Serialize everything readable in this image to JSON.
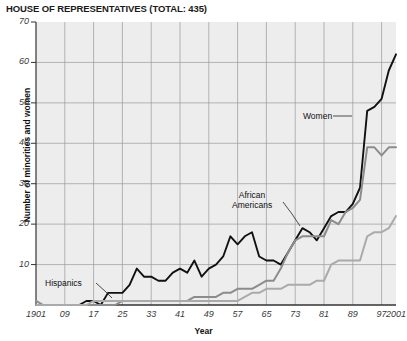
{
  "chart": {
    "title": "HOUSE OF REPRESENTATIVES (TOTAL: 435)",
    "xlabel": "Year",
    "ylabel": "Number of minorities and women"
  },
  "annotations": {
    "women": "Women",
    "african_americans_line1": "African",
    "african_americans_line2": "Americans",
    "hispanics": "Hispanics"
  },
  "axis": {
    "y_ticks": [
      "70",
      "60",
      "50",
      "40",
      "30",
      "20",
      "10"
    ],
    "x_ticks": [
      "1901",
      "09",
      "17",
      "25",
      "33",
      "41",
      "49",
      "57",
      "65",
      "73",
      "81",
      "89",
      "97",
      "2001"
    ]
  },
  "colors": {
    "women_line": "#111111",
    "african_americans_line": "#8c8c8c",
    "hispanics_line": "#aaaaaa",
    "plot_background": "#eeeeee",
    "gridline": "#9a9a9a",
    "axis": "#333333"
  },
  "chart_data": {
    "type": "line",
    "title": "HOUSE OF REPRESENTATIVES (TOTAL: 435)",
    "xlabel": "Year",
    "ylabel": "Number of minorities and women",
    "xlim": [
      1901,
      2001
    ],
    "ylim": [
      0,
      70
    ],
    "grid": true,
    "legend": "annotated-inline",
    "x_tick_labels": [
      "1901",
      "09",
      "17",
      "25",
      "33",
      "41",
      "49",
      "57",
      "65",
      "73",
      "81",
      "89",
      "97",
      "2001"
    ],
    "x_tick_values": [
      1901,
      1909,
      1917,
      1925,
      1933,
      1941,
      1949,
      1957,
      1965,
      1973,
      1981,
      1989,
      1997,
      2001
    ],
    "y_tick_values": [
      10,
      20,
      30,
      40,
      50,
      60,
      70
    ],
    "x": [
      1901,
      1903,
      1905,
      1907,
      1909,
      1911,
      1913,
      1915,
      1917,
      1919,
      1921,
      1923,
      1925,
      1927,
      1929,
      1931,
      1933,
      1935,
      1937,
      1939,
      1941,
      1943,
      1945,
      1947,
      1949,
      1951,
      1953,
      1955,
      1957,
      1959,
      1961,
      1963,
      1965,
      1967,
      1969,
      1971,
      1973,
      1975,
      1977,
      1979,
      1981,
      1983,
      1985,
      1987,
      1989,
      1991,
      1993,
      1995,
      1997,
      1999,
      2001
    ],
    "series": [
      {
        "name": "Women",
        "color": "#111111",
        "values": [
          0,
          0,
          0,
          0,
          0,
          0,
          0,
          1,
          1,
          0,
          3,
          3,
          3,
          5,
          9,
          7,
          7,
          6,
          6,
          8,
          9,
          8,
          11,
          7,
          9,
          10,
          12,
          17,
          15,
          17,
          18,
          12,
          11,
          11,
          10,
          13,
          16,
          19,
          18,
          16,
          19,
          22,
          23,
          23,
          25,
          29,
          48,
          49,
          51,
          58,
          62
        ]
      },
      {
        "name": "African Americans",
        "color": "#8c8c8c",
        "values": [
          1,
          0,
          0,
          0,
          0,
          0,
          0,
          0,
          0,
          0,
          0,
          0,
          1,
          1,
          1,
          1,
          1,
          1,
          1,
          1,
          1,
          1,
          2,
          2,
          2,
          2,
          3,
          3,
          4,
          4,
          4,
          5,
          6,
          6,
          9,
          13,
          16,
          17,
          17,
          17,
          17,
          21,
          20,
          23,
          24,
          26,
          39,
          39,
          37,
          39,
          39
        ]
      },
      {
        "name": "Hispanics",
        "color": "#aaaaaa",
        "values": [
          0,
          0,
          0,
          0,
          0,
          0,
          0,
          0,
          1,
          1,
          1,
          1,
          1,
          1,
          1,
          1,
          1,
          1,
          1,
          1,
          1,
          1,
          1,
          1,
          1,
          1,
          1,
          1,
          1,
          2,
          3,
          3,
          4,
          4,
          4,
          5,
          5,
          5,
          5,
          6,
          6,
          10,
          11,
          11,
          11,
          11,
          17,
          18,
          18,
          19,
          22
        ]
      }
    ]
  }
}
